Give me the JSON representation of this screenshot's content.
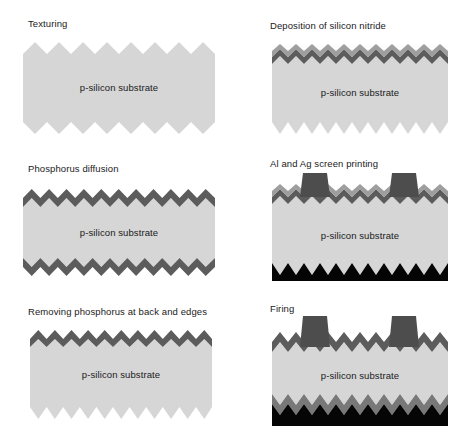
{
  "figure": {
    "substrate_label": "p-silicon substrate",
    "colors": {
      "background": "#ffffff",
      "substrate": "#d4d4d4",
      "emitter_dark": "#5a5a5a",
      "nitride_light": "#9a9a9a",
      "metal_pad": "#4d4d4d",
      "rear_metal": "#000000",
      "text": "#1a1a1a"
    },
    "panels": [
      {
        "id": "texturing",
        "index": 1,
        "title": "Texturing",
        "column": "left",
        "substrate_label": "p-silicon substrate",
        "layers": {
          "top_texture": "plain",
          "bottom_texture": "plain",
          "emitter_top": false,
          "emitter_bottom": false,
          "nitride": false,
          "front_contacts": 0,
          "rear_metal": false
        },
        "teeth_top": 8,
        "teeth_bottom": 8
      },
      {
        "id": "deposition-of-silicon-nitride",
        "index": 2,
        "title": "Deposition of silicon nitride",
        "column": "right",
        "substrate_label": "p-silicon substrate",
        "layers": {
          "top_texture": "coated",
          "bottom_texture": "plain",
          "emitter_top": true,
          "emitter_bottom": false,
          "nitride": true,
          "front_contacts": 0,
          "rear_metal": false
        },
        "teeth_top": 11,
        "teeth_bottom": 11
      },
      {
        "id": "phosphorus-diffusion",
        "index": 3,
        "title": "Phosphorus diffusion",
        "column": "left",
        "substrate_label": "p-silicon substrate",
        "layers": {
          "top_texture": "coated",
          "bottom_texture": "coated",
          "emitter_top": true,
          "emitter_bottom": true,
          "nitride": false,
          "front_contacts": 0,
          "rear_metal": false
        },
        "teeth_top": 11,
        "teeth_bottom": 11
      },
      {
        "id": "al-and-ag-screen-printing",
        "index": 4,
        "title": "Al and Ag screen printing",
        "column": "right",
        "substrate_label": "p-silicon substrate",
        "layers": {
          "top_texture": "coated",
          "bottom_texture": "plain",
          "emitter_top": true,
          "emitter_bottom": false,
          "nitride": true,
          "front_contacts": 2,
          "rear_metal": true
        },
        "teeth_top": 11,
        "teeth_bottom": 11
      },
      {
        "id": "removing-phosphorus-at-back-and-edges",
        "index": 5,
        "title": "Removing phosphorus at back and edges",
        "column": "left",
        "substrate_label": "p-silicon substrate",
        "layers": {
          "top_texture": "coated",
          "bottom_texture": "plain",
          "emitter_top": true,
          "emitter_bottom": false,
          "nitride": false,
          "front_contacts": 0,
          "rear_metal": false
        },
        "teeth_top": 11,
        "teeth_bottom": 11
      },
      {
        "id": "firing",
        "index": 6,
        "title": "Firing",
        "column": "right",
        "substrate_label": "p-silicon substrate",
        "layers": {
          "top_texture": "coated",
          "bottom_texture": "coated",
          "emitter_top": true,
          "emitter_bottom": true,
          "nitride": false,
          "front_contacts": 2,
          "rear_metal": true
        },
        "teeth_top": 11,
        "teeth_bottom": 11
      }
    ]
  }
}
